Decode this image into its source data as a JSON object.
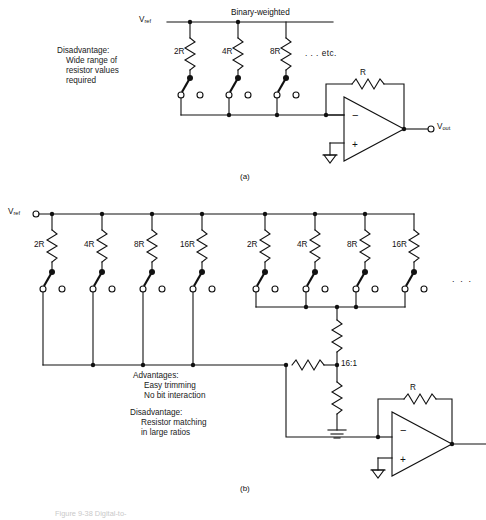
{
  "figure": {
    "title_caption_partial": "Figure 9-38  Digital-to-",
    "panel_a": {
      "caption": "(a)",
      "header_label": "Binary-weighted",
      "vref_label": "V",
      "vref_sub": "ref",
      "vout_label": "V",
      "vout_sub": "out",
      "feedback_resistor": "R",
      "resistors": [
        "2R",
        "4R",
        "8R"
      ],
      "etc_label": ". . . etc.",
      "note_lines": [
        "Disadvantage:",
        "Wide range of",
        "resistor values",
        "required"
      ],
      "opamp_minus": "−",
      "opamp_plus": "+"
    },
    "panel_b": {
      "caption": "(b)",
      "vref_label": "V",
      "vref_sub": "ref",
      "feedback_resistor": "R",
      "divider_label": "16:1",
      "group1_resistors": [
        "2R",
        "4R",
        "8R",
        "16R"
      ],
      "group2_resistors": [
        "2R",
        "4R",
        "8R",
        "16R"
      ],
      "ellipsis": ". . .",
      "note_lines_advantages": [
        "Advantages:",
        "Easy trimming",
        "No bit interaction"
      ],
      "note_lines_disadvantage": [
        "Disadvantage:",
        "Resistor matching",
        "in large ratios"
      ],
      "opamp_minus": "−",
      "opamp_plus": "+"
    },
    "colors": {
      "ink": "#111111",
      "paper": "#ffffff",
      "faint": "#c9c9c9"
    }
  }
}
